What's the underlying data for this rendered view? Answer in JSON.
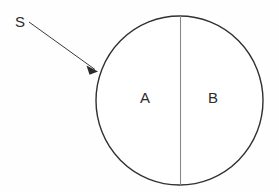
{
  "figure": {
    "background_color": "#fefefe",
    "outline_color": "#303030",
    "divider_color": "#8a8a8a",
    "leader_color": "#3a3a3a",
    "text_color": "#2b2b2b",
    "callout": {
      "label": "S",
      "label_x": 15,
      "label_y": 27,
      "line_start_x": 29,
      "line_start_y": 22,
      "line_end_x": 96,
      "line_end_y": 70,
      "arrow_tip_x": 98,
      "arrow_tip_y": 71
    },
    "circle": {
      "center_x": 179.5,
      "center_y": 100.5,
      "radius_x": 83.5,
      "radius_y": 84.5
    },
    "divider": {
      "x": 180.5,
      "y_top": 16,
      "y_bottom": 185
    },
    "regions": [
      {
        "label": "A",
        "x": 140,
        "y": 103
      },
      {
        "label": "B",
        "x": 208,
        "y": 103
      }
    ]
  }
}
